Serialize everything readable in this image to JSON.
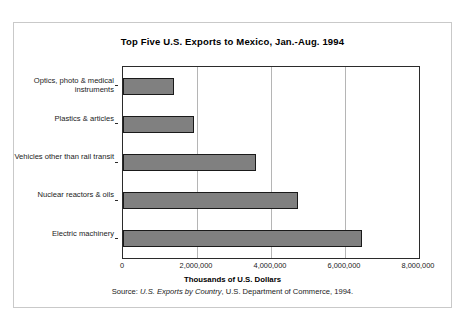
{
  "chart_data": {
    "type": "bar",
    "orientation": "horizontal",
    "title": "Top Five U.S. Exports to Mexico, Jan.-Aug. 1994",
    "xlabel": "Thousands of U.S. Dollars",
    "ylabel": "",
    "source": {
      "prefix": "Source: ",
      "italic": "U.S. Exports by Country",
      "suffix": ", U.S. Department of Commerce, 1994."
    },
    "categories": [
      "Optics, photo & medical instruments",
      "Plastics & articles",
      "Vehicles other than rail transit",
      "Nuclear reactors & oils",
      "Electric machinery"
    ],
    "values": [
      1370000,
      1910000,
      3600000,
      4740000,
      6460000
    ],
    "xlim": [
      0,
      8000000
    ],
    "xticks": [
      0,
      2000000,
      4000000,
      6000000,
      8000000
    ],
    "xtick_labels": [
      "0",
      "2,000,000",
      "4,000,000",
      "6,000,000",
      "8,000,000"
    ],
    "grid": true,
    "legend": false,
    "bar_color": "#808080",
    "bar_border_color": "#1a1a1a",
    "axis_color": "#2b2b2b",
    "gridline_color": "#b5b5b5"
  }
}
